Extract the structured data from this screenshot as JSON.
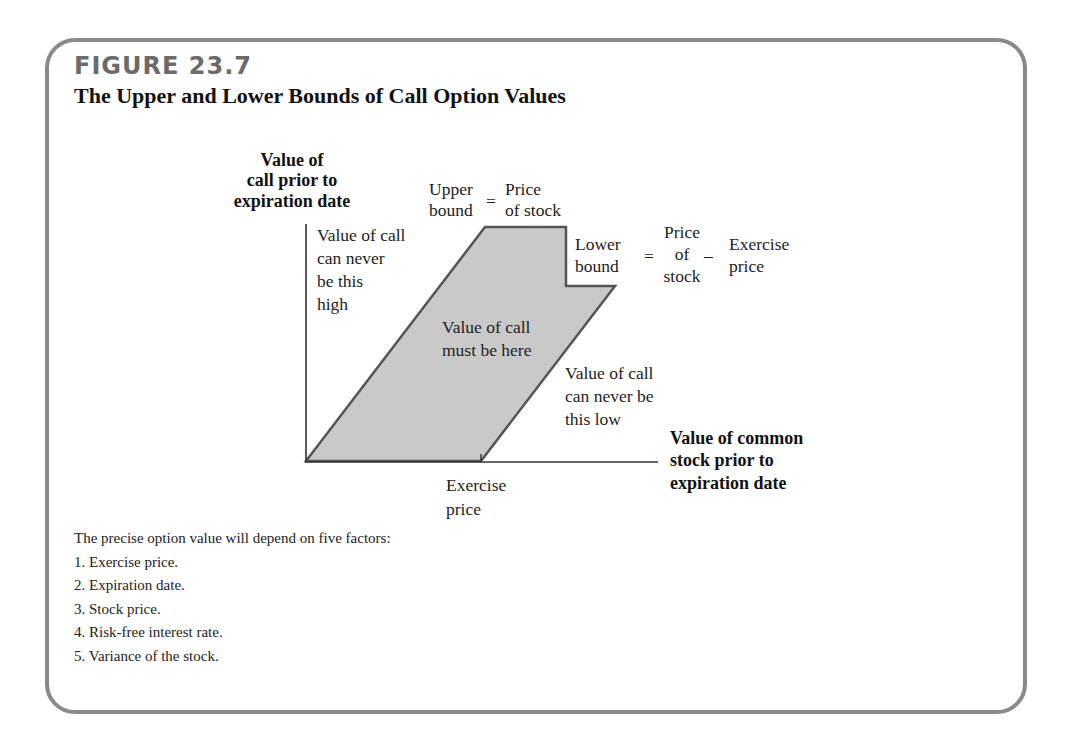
{
  "figure": {
    "number": "FIGURE 23.7",
    "title": "The Upper and Lower Bounds of Call Option Values"
  },
  "diagram": {
    "y_axis_label": [
      "Value of",
      "call prior to",
      "expiration date"
    ],
    "x_axis_label": [
      "Value of common",
      "stock prior to",
      "expiration date"
    ],
    "upper_bound": {
      "left": [
        "Upper",
        "bound"
      ],
      "equals": "=",
      "right": [
        "Price",
        "of stock"
      ]
    },
    "lower_bound": {
      "left": [
        "Lower",
        "bound"
      ],
      "equals": "=",
      "middle": [
        "Price",
        "of",
        "stock"
      ],
      "minus": "–",
      "right": [
        "Exercise",
        "price"
      ]
    },
    "region_above": [
      "Value of call",
      "can never",
      "be this",
      "high"
    ],
    "region_inside": [
      "Value of call",
      "must be here"
    ],
    "region_below": [
      "Value of call",
      "can never be",
      "this low"
    ],
    "x_tick_label": [
      "Exercise",
      "price"
    ],
    "colors": {
      "fill": "#c9c9c9",
      "outline": "#555555",
      "axis": "#333333",
      "frame": "#8a8a8a",
      "figure_number": "#6b6b6b"
    }
  },
  "notes": {
    "intro": "The precise option value will depend on five factors:",
    "items": [
      "1. Exercise price.",
      "2. Expiration date.",
      "3. Stock price.",
      "4. Risk-free interest rate.",
      "5. Variance of the stock."
    ]
  }
}
